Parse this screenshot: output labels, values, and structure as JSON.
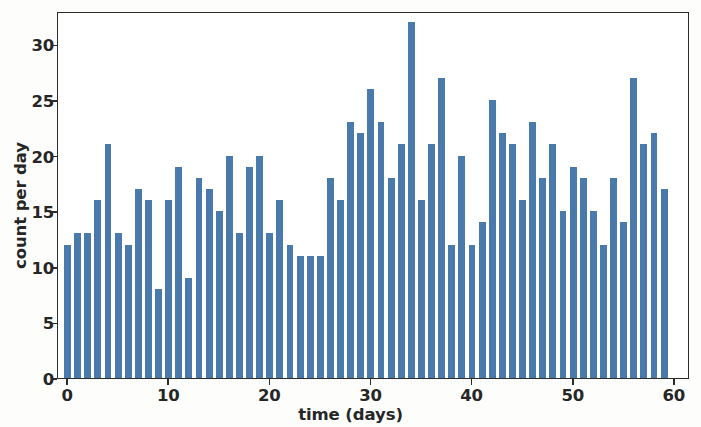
{
  "chart_data": {
    "type": "bar",
    "title": "",
    "xlabel": "time (days)",
    "ylabel": "count per day",
    "xlim": [
      -1.0,
      61.5
    ],
    "ylim": [
      0,
      33.0
    ],
    "xticks": [
      0,
      10,
      20,
      30,
      40,
      50,
      60
    ],
    "xtick_labels": [
      "0",
      "10",
      "20",
      "30",
      "40",
      "50",
      "60"
    ],
    "yticks": [
      0,
      5,
      10,
      15,
      20,
      25,
      30
    ],
    "ytick_labels": [
      "0",
      "5",
      "10",
      "15",
      "20",
      "25",
      "30"
    ],
    "grid": false,
    "legend": null,
    "bar_color": "#4a79ac",
    "bar_width": 0.8,
    "x": [
      0,
      1,
      2,
      3,
      4,
      5,
      6,
      7,
      8,
      9,
      10,
      11,
      12,
      13,
      14,
      15,
      16,
      17,
      18,
      19,
      20,
      21,
      22,
      23,
      24,
      25,
      26,
      27,
      28,
      29,
      30,
      31,
      32,
      33,
      34,
      35,
      36,
      37,
      38,
      39,
      40,
      41,
      42,
      43,
      44,
      45,
      46,
      47,
      48,
      49,
      50,
      51,
      52,
      53,
      54,
      55,
      56,
      57,
      58,
      59
    ],
    "values": [
      12,
      13,
      13,
      16,
      21,
      13,
      12,
      17,
      16,
      8,
      16,
      19,
      9,
      18,
      17,
      15,
      20,
      13,
      19,
      20,
      13,
      16,
      12,
      11,
      11,
      11,
      18,
      16,
      23,
      22,
      26,
      23,
      18,
      21,
      32,
      16,
      21,
      27,
      12,
      20,
      12,
      14,
      25,
      22,
      21,
      16,
      23,
      18,
      21,
      15,
      19,
      18,
      15,
      12,
      18,
      14,
      27,
      21,
      22,
      17
    ]
  },
  "figure": {
    "background_color": "#ffffff",
    "axis_color": "#2b2b2b"
  }
}
